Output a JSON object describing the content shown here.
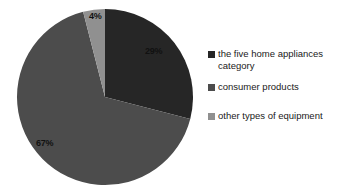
{
  "chart_data": {
    "type": "pie",
    "title": "",
    "subtitle": "",
    "xlabel": "",
    "ylabel": "",
    "grid": false,
    "legend_position": "right",
    "categories": [
      "the five home appliances category",
      "consumer products",
      "other types of equipment"
    ],
    "values": [
      29,
      67,
      4
    ],
    "value_labels": [
      "29%",
      "67%",
      "4%"
    ],
    "units": "percent",
    "colors": [
      "#262626",
      "#4c4c4c",
      "#909090"
    ],
    "start_angle_deg": 0,
    "direction": "clockwise",
    "slices": [
      {
        "label": "the five home appliances category",
        "value": 29,
        "value_label": "29%",
        "color": "#262626",
        "start_angle_deg": 0,
        "end_angle_deg": 104.4
      },
      {
        "label": "consumer products",
        "value": 67,
        "value_label": "67%",
        "color": "#4c4c4c",
        "start_angle_deg": 104.4,
        "end_angle_deg": 345.6
      },
      {
        "label": "other types of equipment",
        "value": 4,
        "value_label": "4%",
        "color": "#909090",
        "start_angle_deg": 345.6,
        "end_angle_deg": 360
      }
    ]
  },
  "pie": {
    "label_29": "29%",
    "label_67": "67%",
    "label_4": "4%"
  },
  "legend": {
    "items": [
      {
        "label": "the five home appliances category",
        "color": "#262626"
      },
      {
        "label": "consumer products",
        "color": "#4c4c4c"
      },
      {
        "label": "other types of equipment",
        "color": "#909090"
      }
    ]
  }
}
